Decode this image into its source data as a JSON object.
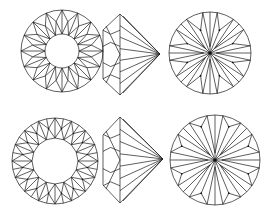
{
  "figure": {
    "width": 274,
    "height": 218,
    "background": "#ffffff",
    "stroke_color": "#1a1a1a",
    "rows": [
      {
        "name": "single-cut",
        "crown_top": {
          "cx": 62,
          "cy": 51,
          "r": 41,
          "table_r": 17,
          "mid_r": 30,
          "facets": 16
        },
        "profile": {
          "top_x": 120,
          "top_y": 14,
          "bottom_y": 95,
          "left_x": 103,
          "girdle_top_y": 30,
          "girdle_bottom_y": 79,
          "tip_x": 160,
          "tip_y": 54
        },
        "pavilion": {
          "cx": 210,
          "cy": 53,
          "r": 41,
          "mains": 8,
          "star_r": 0.6
        }
      },
      {
        "name": "brilliant-cut",
        "crown_top": {
          "cx": 55,
          "cy": 161,
          "r": 43,
          "table_r": 23,
          "mid_r": 33,
          "facets": 16
        },
        "profile": {
          "top_x": 120,
          "top_y": 117,
          "bottom_y": 203,
          "left_x": 103,
          "girdle_top_y": 135,
          "girdle_bottom_y": 185,
          "tip_x": 163,
          "tip_y": 159
        },
        "pavilion": {
          "cx": 215,
          "cy": 160,
          "r": 45,
          "mains": 8,
          "star_r": 0.8
        }
      }
    ]
  }
}
